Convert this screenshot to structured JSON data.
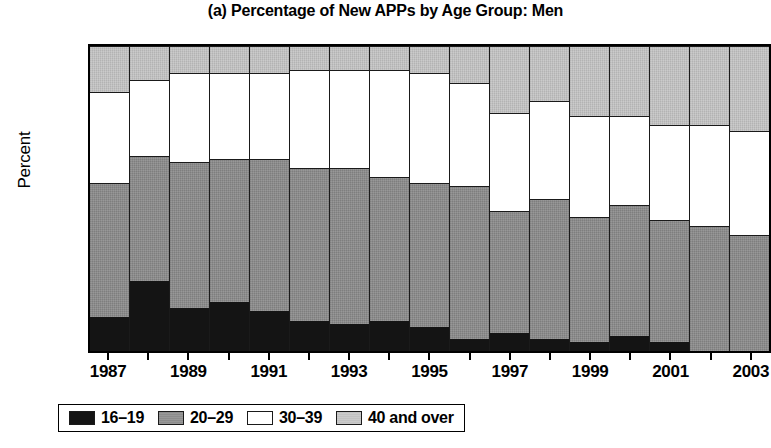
{
  "chart_data": {
    "type": "bar",
    "subtype": "stacked-bar-100-percent",
    "title": "(a) Percentage of New APPs by Age Group: Men",
    "xlabel": "",
    "ylabel": "Percent",
    "ylim": [
      0,
      100
    ],
    "ytick_step": 10,
    "yticks": [
      0,
      10,
      20,
      30,
      40,
      50,
      60,
      70,
      80,
      90,
      100
    ],
    "grid": false,
    "legend_position": "below-axis-left",
    "categories": [
      "1987",
      "1988",
      "1989",
      "1990",
      "1991",
      "1992",
      "1993",
      "1994",
      "1995",
      "1996",
      "1997",
      "1998",
      "1999",
      "2000",
      "2001",
      "2002",
      "2003"
    ],
    "xtick_labels_shown": [
      "1987",
      "1989",
      "1991",
      "1993",
      "1995",
      "1997",
      "1999",
      "2001",
      "2003"
    ],
    "series": [
      {
        "name": "16–19",
        "color": "#141414",
        "values": [
          11,
          23,
          14,
          16,
          13,
          10,
          9,
          10,
          8,
          4,
          6,
          4,
          3,
          5,
          3,
          0,
          0
        ]
      },
      {
        "name": "20–29",
        "color": "#8c8c8c",
        "values": [
          44,
          41,
          48,
          47,
          50,
          50,
          51,
          47,
          47,
          50,
          40,
          46,
          41,
          43,
          40,
          41,
          38
        ]
      },
      {
        "name": "30–39",
        "color": "#ffffff",
        "values": [
          30,
          25,
          29,
          28,
          28,
          32,
          32,
          35,
          36,
          34,
          32,
          32,
          33,
          29,
          31,
          33,
          34
        ]
      },
      {
        "name": "40 and over",
        "color": "#c2c2c2",
        "values": [
          15,
          11,
          9,
          9,
          9,
          8,
          8,
          8,
          9,
          12,
          22,
          18,
          23,
          23,
          26,
          26,
          28
        ]
      }
    ],
    "cumulative_tops": {
      "16_19": [
        11,
        23,
        14,
        16,
        13,
        10,
        9,
        10,
        8,
        4,
        6,
        4,
        3,
        5,
        3,
        0,
        0
      ],
      "20_29": [
        55,
        64,
        62,
        63,
        63,
        60,
        60,
        57,
        55,
        54,
        46,
        50,
        44,
        48,
        43,
        41,
        38
      ],
      "30_39": [
        85,
        89,
        91,
        91,
        91,
        92,
        92,
        92,
        91,
        88,
        78,
        82,
        77,
        77,
        74,
        74,
        72
      ],
      "40_over": [
        100,
        100,
        100,
        100,
        100,
        100,
        100,
        100,
        100,
        100,
        100,
        100,
        100,
        100,
        100,
        100,
        100
      ]
    }
  },
  "legend": {
    "items": [
      {
        "label": "16–19",
        "swatch": "black-swatch"
      },
      {
        "label": "20–29",
        "swatch": "dark-gray-swatch"
      },
      {
        "label": "30–39",
        "swatch": "white-swatch"
      },
      {
        "label": "40 and over",
        "swatch": "light-gray-swatch"
      }
    ]
  }
}
